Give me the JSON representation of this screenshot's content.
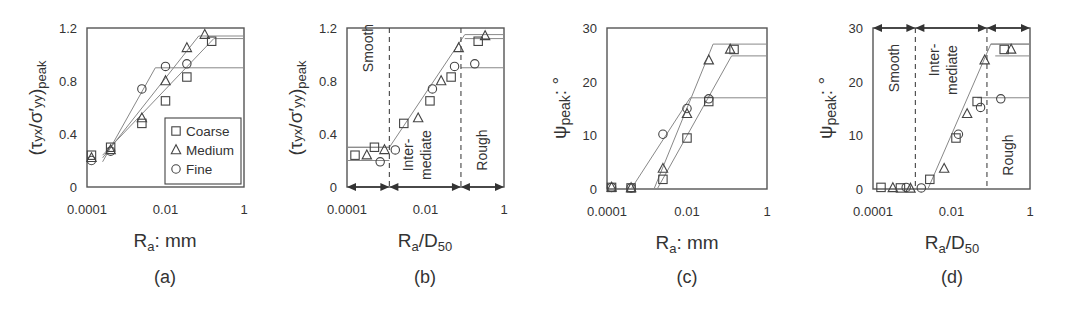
{
  "figure": {
    "panels": [
      {
        "id": "a",
        "label": "(a)"
      },
      {
        "id": "b",
        "label": "(b)"
      },
      {
        "id": "c",
        "label": "(c)"
      },
      {
        "id": "d",
        "label": "(d)"
      }
    ]
  },
  "legend": {
    "items": [
      {
        "name": "Coarse",
        "marker": "square"
      },
      {
        "name": "Medium",
        "marker": "triangle"
      },
      {
        "name": "Fine",
        "marker": "circle"
      }
    ]
  },
  "regions": {
    "smooth": "Smooth",
    "intermediate_1": "Inter-",
    "intermediate_2": "mediate",
    "rough": "Rough"
  },
  "chart_data": [
    {
      "panel": "(a)",
      "type": "scatter",
      "xscale": "log",
      "xlabel": "Ra: mm",
      "ylabel": "(τyx/σ'yy)peak",
      "xlim": [
        0.0001,
        1
      ],
      "ylim": [
        0,
        1.2
      ],
      "xticks": [
        "0.0001",
        "0.01",
        "1"
      ],
      "yticks": [
        "0",
        "0.4",
        "0.8",
        "1.2"
      ],
      "legend_position": "lower right",
      "series": [
        {
          "name": "Coarse",
          "marker": "square",
          "points": [
            [
              0.00013,
              0.24
            ],
            [
              0.0004,
              0.3
            ],
            [
              0.0025,
              0.48
            ],
            [
              0.01,
              0.65
            ],
            [
              0.035,
              0.83
            ],
            [
              0.15,
              1.1
            ]
          ],
          "fit": [
            [
              0.00025,
              0.24
            ],
            [
              0.17,
              1.12
            ],
            [
              1,
              1.12
            ]
          ]
        },
        {
          "name": "Medium",
          "marker": "triangle",
          "points": [
            [
              0.00013,
              0.22
            ],
            [
              0.0004,
              0.28
            ],
            [
              0.0025,
              0.52
            ],
            [
              0.01,
              0.8
            ],
            [
              0.035,
              1.05
            ],
            [
              0.1,
              1.15
            ]
          ],
          "fit": [
            [
              0.00025,
              0.22
            ],
            [
              0.07,
              1.14
            ],
            [
              1,
              1.14
            ]
          ]
        },
        {
          "name": "Fine",
          "marker": "circle",
          "points": [
            [
              0.00013,
              0.2
            ],
            [
              0.0004,
              0.27
            ],
            [
              0.0025,
              0.74
            ],
            [
              0.01,
              0.91
            ],
            [
              0.035,
              0.93
            ]
          ],
          "fit": [
            [
              0.00025,
              0.19
            ],
            [
              0.0055,
              0.9
            ],
            [
              1,
              0.9
            ]
          ]
        }
      ]
    },
    {
      "panel": "(b)",
      "type": "scatter",
      "xscale": "log",
      "xlabel": "Ra/D50",
      "ylabel": "(τyx/σ'yy)peak",
      "xlim": [
        0.0001,
        1
      ],
      "ylim": [
        0,
        1.2
      ],
      "xticks": [
        "0.0001",
        "0.01",
        "1"
      ],
      "yticks": [
        "0",
        "0.4",
        "0.8",
        "1.2"
      ],
      "region_boundaries": [
        0.0012,
        0.08
      ],
      "regions": [
        "Smooth",
        "Intermediate",
        "Rough"
      ],
      "series": [
        {
          "name": "Coarse",
          "marker": "square",
          "points": [
            [
              0.00016,
              0.24
            ],
            [
              0.0005,
              0.3
            ],
            [
              0.0028,
              0.48
            ],
            [
              0.013,
              0.65
            ],
            [
              0.045,
              0.83
            ],
            [
              0.22,
              1.1
            ]
          ]
        },
        {
          "name": "Medium",
          "marker": "triangle",
          "points": [
            [
              0.00032,
              0.24
            ],
            [
              0.0009,
              0.28
            ],
            [
              0.0065,
              0.52
            ],
            [
              0.025,
              0.8
            ],
            [
              0.07,
              1.05
            ],
            [
              0.33,
              1.14
            ]
          ]
        },
        {
          "name": "Fine",
          "marker": "circle",
          "points": [
            [
              0.0007,
              0.19
            ],
            [
              0.0017,
              0.28
            ],
            [
              0.015,
              0.74
            ],
            [
              0.055,
              0.91
            ],
            [
              0.18,
              0.93
            ]
          ]
        }
      ],
      "fit": [
        [
          0.0001,
          0.3
        ],
        [
          0.0012,
          0.3
        ],
        [
          0.1,
          1.15
        ],
        [
          1,
          1.15
        ]
      ],
      "plateaus": [
        {
          "y": 0.3,
          "x": [
            0.0001,
            0.0012
          ]
        },
        {
          "y": 0.2,
          "x": [
            0.0001,
            0.0012
          ]
        },
        {
          "y": 0.9,
          "x": [
            0.08,
            1
          ]
        },
        {
          "y": 1.12,
          "x": [
            0.1,
            1
          ]
        }
      ]
    },
    {
      "panel": "(c)",
      "type": "scatter",
      "xscale": "log",
      "xlabel": "Ra: mm",
      "ylabel": "ψpeak: °",
      "xlim": [
        0.0001,
        1
      ],
      "ylim": [
        0,
        30
      ],
      "xticks": [
        "0.0001",
        "0.01",
        "1"
      ],
      "yticks": [
        "0",
        "10",
        "20",
        "30"
      ],
      "series": [
        {
          "name": "Coarse",
          "marker": "square",
          "points": [
            [
              0.00013,
              0.3
            ],
            [
              0.0004,
              0.2
            ],
            [
              0.0025,
              1.8
            ],
            [
              0.01,
              9.5
            ],
            [
              0.035,
              16.3
            ],
            [
              0.15,
              26
            ]
          ],
          "fit": [
            [
              0.0018,
              0
            ],
            [
              0.13,
              24.8
            ],
            [
              1,
              24.8
            ]
          ]
        },
        {
          "name": "Medium",
          "marker": "triangle",
          "points": [
            [
              0.00013,
              0.3
            ],
            [
              0.0004,
              0.2
            ],
            [
              0.0025,
              3.8
            ],
            [
              0.01,
              14
            ],
            [
              0.035,
              24
            ],
            [
              0.12,
              26
            ]
          ],
          "fit": [
            [
              0.0015,
              0
            ],
            [
              0.045,
              27
            ],
            [
              1,
              27
            ]
          ]
        },
        {
          "name": "Fine",
          "marker": "circle",
          "points": [
            [
              0.00013,
              0.3
            ],
            [
              0.0004,
              0.2
            ],
            [
              0.0025,
              10.2
            ],
            [
              0.01,
              15
            ],
            [
              0.035,
              16.8
            ]
          ],
          "fit": [
            [
              0.0004,
              0
            ],
            [
              0.012,
              17
            ],
            [
              1,
              17
            ]
          ]
        }
      ]
    },
    {
      "panel": "(d)",
      "type": "scatter",
      "xscale": "log",
      "xlabel": "Ra/D50",
      "ylabel": "ψpeak: °",
      "xlim": [
        0.0001,
        1
      ],
      "ylim": [
        0,
        30
      ],
      "xticks": [
        "0.0001",
        "0.01",
        "1"
      ],
      "yticks": [
        "0",
        "10",
        "20",
        "30"
      ],
      "region_boundaries": [
        0.0012,
        0.08
      ],
      "regions": [
        "Smooth",
        "Intermediate",
        "Rough"
      ],
      "series": [
        {
          "name": "Coarse",
          "marker": "square",
          "points": [
            [
              0.00016,
              0.3
            ],
            [
              0.0005,
              0.2
            ],
            [
              0.0028,
              1.8
            ],
            [
              0.013,
              9.5
            ],
            [
              0.045,
              16.3
            ],
            [
              0.22,
              26
            ]
          ]
        },
        {
          "name": "Medium",
          "marker": "triangle",
          "points": [
            [
              0.00032,
              0.2
            ],
            [
              0.0009,
              0.1
            ],
            [
              0.0065,
              3.8
            ],
            [
              0.025,
              14
            ],
            [
              0.07,
              24
            ],
            [
              0.33,
              26
            ]
          ]
        },
        {
          "name": "Fine",
          "marker": "circle",
          "points": [
            [
              0.0007,
              0.3
            ],
            [
              0.0017,
              0.2
            ],
            [
              0.015,
              10.2
            ],
            [
              0.055,
              15.2
            ],
            [
              0.18,
              16.8
            ]
          ]
        }
      ],
      "fit": [
        [
          0.0025,
          0
        ],
        [
          0.1,
          27
        ],
        [
          1,
          27
        ]
      ],
      "plateaus": [
        {
          "y": 27,
          "x": [
            0.1,
            1
          ]
        },
        {
          "y": 24.8,
          "x": [
            0.13,
            1
          ]
        },
        {
          "y": 17,
          "x": [
            0.045,
            1
          ]
        }
      ]
    }
  ]
}
